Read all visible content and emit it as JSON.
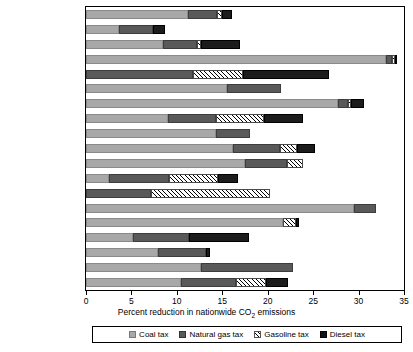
{
  "chart_data": {
    "type": "bar",
    "orientation": "horizontal",
    "stacked": true,
    "title": "",
    "xlabel": "Percent reduction in nationwide CO2 emissions",
    "ylabel": "",
    "xlim": [
      0,
      35
    ],
    "xticks": [
      0,
      5,
      10,
      15,
      20,
      25,
      30,
      35
    ],
    "grid": false,
    "legend_position": "bottom",
    "categories": [
      "Australia",
      "Brazil",
      "Chile",
      "China",
      "Egypt",
      "Germany",
      "India",
      "Indonesia",
      "Israel",
      "Japan",
      "Kazakhstan",
      "Mexico",
      "Nigeria",
      "Poland",
      "South Africa",
      "Thailand",
      "Turkey",
      "United Kingdom",
      "United States"
    ],
    "series": [
      {
        "name": "Coal tax",
        "color": "#a8a8a8",
        "values": [
          11.2,
          3.6,
          8.5,
          33.0,
          0.0,
          15.5,
          27.7,
          9.0,
          14.3,
          16.2,
          17.5,
          2.5,
          0.0,
          29.5,
          21.7,
          5.2,
          7.9,
          12.7,
          10.5
        ]
      },
      {
        "name": "Natural gas tax",
        "color": "#595959",
        "values": [
          3.2,
          3.8,
          3.7,
          0.7,
          11.8,
          6.0,
          1.1,
          5.3,
          3.8,
          5.1,
          4.6,
          6.6,
          7.1,
          2.4,
          0.0,
          6.1,
          5.3,
          10.1,
          6.0
        ]
      },
      {
        "name": "Gasoline tax",
        "color": "#ffffff",
        "hatched": true,
        "values": [
          0.6,
          0.0,
          0.5,
          0.3,
          5.5,
          0.0,
          0.4,
          5.3,
          0.0,
          1.9,
          1.8,
          5.4,
          13.2,
          0.0,
          1.4,
          0.0,
          0.0,
          0.0,
          3.3
        ]
      },
      {
        "name": "Diesel tax",
        "color": "#1c1c1c",
        "values": [
          1.1,
          1.3,
          4.2,
          0.2,
          9.4,
          0.0,
          1.4,
          4.3,
          0.0,
          2.0,
          0.0,
          2.2,
          0.0,
          0.0,
          0.3,
          6.6,
          0.4,
          0.0,
          2.4
        ]
      }
    ],
    "totals": [
      16.1,
      8.7,
      16.9,
      34.2,
      26.7,
      21.5,
      30.6,
      23.9,
      18.1,
      25.2,
      23.9,
      16.7,
      20.3,
      31.9,
      23.4,
      17.9,
      13.6,
      22.8,
      22.2
    ]
  },
  "axis": {
    "x_title_prefix": "Percent reduction in nationwide CO",
    "x_title_sub": "2",
    "x_title_suffix": " emissions",
    "tick_labels": [
      "0",
      "5",
      "10",
      "15",
      "20",
      "25",
      "30",
      "35"
    ]
  },
  "legend": {
    "items": [
      {
        "label": "Coal tax",
        "key": "coal"
      },
      {
        "label": "Natural gas tax",
        "key": "gas"
      },
      {
        "label": "Gasoline tax",
        "key": "gasoline"
      },
      {
        "label": "Diesel tax",
        "key": "diesel"
      }
    ]
  }
}
